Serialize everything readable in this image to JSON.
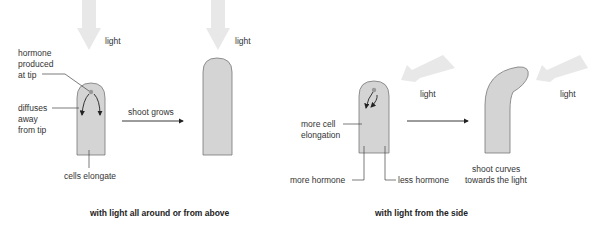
{
  "left_panel": {
    "caption": "with light all around or from above",
    "light_label_1": "light",
    "light_label_2": "light",
    "hormone_label_1": "hormone",
    "hormone_label_2": "produced",
    "hormone_label_3": "at tip",
    "diffuses_label_1": "diffuses",
    "diffuses_label_2": "away",
    "diffuses_label_3": "from tip",
    "cells_label": "cells elongate",
    "arrow_label": "shoot grows"
  },
  "right_panel": {
    "caption": "with light from the side",
    "light_label_1": "light",
    "light_label_2": "light",
    "elongation_label_1": "more cell",
    "elongation_label_2": "elongation",
    "more_hormone_label": "more hormone",
    "less_hormone_label": "less hormone",
    "curves_label_1": "shoot curves",
    "curves_label_2": "towards the light"
  },
  "colors": {
    "shoot_fill": "#d4d4d4",
    "shoot_stroke": "#777777",
    "light_arrow": "#e6e6e6",
    "text": "#333333"
  }
}
